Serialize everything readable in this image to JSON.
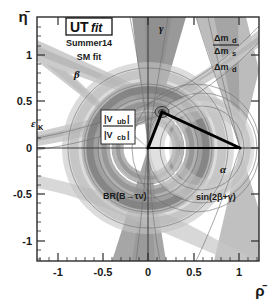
{
  "figure": {
    "kind": "unitarity-triangle-plot",
    "logo": {
      "brand_main": "UT",
      "brand_sub": "fit",
      "season": "Summer14",
      "fit_label": "SM fit"
    },
    "axes": {
      "xlabel": "ρ̄",
      "ylabel": "η̄",
      "xticks": [
        "-1",
        "-0.5",
        "0",
        "0.5",
        "1"
      ],
      "xtick_values": [
        -1,
        -0.5,
        0,
        0.5,
        1
      ],
      "yticks": [
        "1",
        "0.5",
        "0",
        "-0.5",
        "-1"
      ],
      "ytick_values": [
        1,
        0.5,
        0,
        -0.5,
        -1
      ],
      "xlim": [
        -1.28,
        1.26
      ],
      "ylim": [
        -1.33,
        1.28
      ]
    },
    "constraint_labels": [
      {
        "id": "gamma",
        "text": "γ",
        "x": 159,
        "y": 32,
        "style": "greek"
      },
      {
        "id": "beta",
        "text": "β",
        "x": 76,
        "y": 75,
        "style": "greek"
      },
      {
        "id": "epsk",
        "text": "ε",
        "sub": "K",
        "x": 35,
        "y": 125,
        "style": "greek-sub"
      },
      {
        "id": "dmd-dms-num",
        "text": "Δm",
        "sub": "d",
        "x": 218,
        "y": 39,
        "style": "ratio-num"
      },
      {
        "id": "dmd-dms-den",
        "text": "Δm",
        "sub": "s",
        "x": 218,
        "y": 52,
        "style": "ratio-den"
      },
      {
        "id": "dmd",
        "text": "Δm",
        "sub": "d",
        "x": 218,
        "y": 68,
        "style": "plain"
      },
      {
        "id": "vub-vcb-num",
        "text": "|V",
        "sub": "ub",
        "x": 106,
        "y": 122,
        "style": "ratio-num"
      },
      {
        "id": "vub-vcb-den",
        "text": "|V",
        "sub": "cb",
        "x": 106,
        "y": 138,
        "style": "ratio-den"
      },
      {
        "id": "brbtaunu",
        "text": "BR(B→τν)",
        "x": 105,
        "y": 196,
        "style": "plain"
      },
      {
        "id": "sin2bg",
        "text": "sin(2β+γ)",
        "x": 196,
        "y": 198,
        "style": "plain"
      },
      {
        "id": "alpha",
        "text": "α",
        "x": 222,
        "y": 170,
        "style": "greek"
      }
    ],
    "triangle": {
      "apex": {
        "rho": 0.14,
        "eta": 0.35
      },
      "origin": {
        "rho": 0.0,
        "eta": 0.0
      },
      "vertex_c": {
        "rho": 1.0,
        "eta": 0.0
      }
    },
    "colors": {
      "frame": "#2b2b2b",
      "axis_line": "#3a3a3a",
      "triangle": "#000000",
      "band_gamma": "#9b9b9b",
      "band_alpha": "#b4b4b4",
      "band_beta": "#c9c9c9",
      "band_epsk": "#c2c2c2",
      "band_dm": "#8f8f8f",
      "band_vub": "#a8a8a8",
      "band_btaunu": "#bdbdbd",
      "band_sin2bg": "#d2d2d2",
      "background": "#ffffff"
    }
  }
}
